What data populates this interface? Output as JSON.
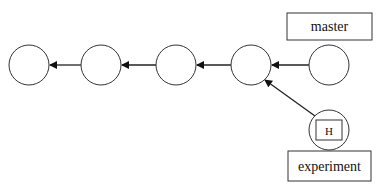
{
  "diagram": {
    "type": "git-commit-graph",
    "commits": [
      {
        "id": "c1",
        "cx": 29,
        "cy": 65
      },
      {
        "id": "c2",
        "cx": 101,
        "cy": 65
      },
      {
        "id": "c3",
        "cx": 176,
        "cy": 65
      },
      {
        "id": "c4",
        "cx": 251,
        "cy": 65
      },
      {
        "id": "c5",
        "cx": 329,
        "cy": 65
      },
      {
        "id": "c6",
        "cx": 329,
        "cy": 130
      }
    ],
    "edges": [
      {
        "from": "c2",
        "to": "c1"
      },
      {
        "from": "c3",
        "to": "c2"
      },
      {
        "from": "c4",
        "to": "c3"
      },
      {
        "from": "c5",
        "to": "c4"
      },
      {
        "from": "c6",
        "to": "c4"
      }
    ],
    "labels": {
      "master": "master",
      "experiment": "experiment",
      "head": "H"
    },
    "colors": {
      "stroke": "#222222",
      "background": "#ffffff"
    }
  }
}
